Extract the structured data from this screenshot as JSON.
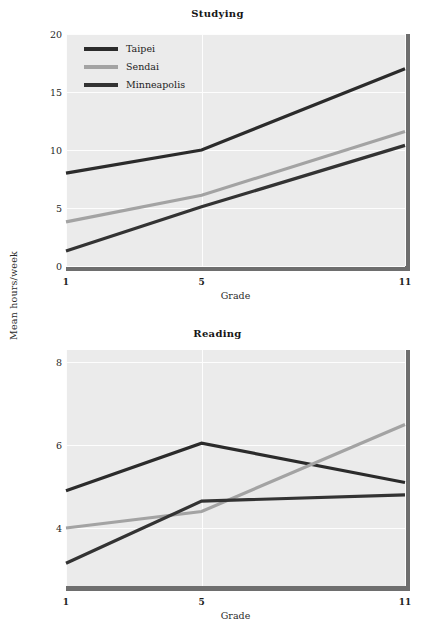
{
  "figure": {
    "shared_ylabel": "Mean hours/week",
    "width": 435,
    "height": 638
  },
  "colors": {
    "taipei": "#2b2b2b",
    "sendai": "#a3a3a3",
    "minneapolis": "#333333",
    "panel_background": "#ebebeb",
    "gridline": "#fdfdfd",
    "panel_shadow": "#6e6e6e",
    "text": "#1a1a1a"
  },
  "legend": {
    "items": [
      {
        "label": "Taipei",
        "color_key": "taipei"
      },
      {
        "label": "Sendai",
        "color_key": "sendai"
      },
      {
        "label": "Minneapolis",
        "color_key": "minneapolis"
      }
    ]
  },
  "chart_data": [
    {
      "type": "line",
      "title": "Studying",
      "xlabel": "Grade",
      "ylabel": "Mean hours/week",
      "x": [
        1,
        5,
        11
      ],
      "xticklabels": [
        "1",
        "5",
        "11"
      ],
      "xlim": [
        1,
        11
      ],
      "ylim": [
        0,
        20
      ],
      "yticks": [
        0,
        5,
        10,
        15,
        20
      ],
      "yticklabels": [
        "0",
        "5",
        "10",
        "15",
        "20"
      ],
      "grid": true,
      "legend_position": "upper left",
      "series": [
        {
          "name": "Taipei",
          "values": [
            8.0,
            10.0,
            17.0
          ]
        },
        {
          "name": "Sendai",
          "values": [
            3.8,
            6.1,
            11.6
          ]
        },
        {
          "name": "Minneapolis",
          "values": [
            1.3,
            5.1,
            10.4
          ]
        }
      ]
    },
    {
      "type": "line",
      "title": "Reading",
      "xlabel": "Grade",
      "ylabel": "Mean hours/week",
      "x": [
        1,
        5,
        11
      ],
      "xticklabels": [
        "1",
        "5",
        "11"
      ],
      "xlim": [
        1,
        11
      ],
      "ylim": [
        2.6,
        8.3
      ],
      "yticks": [
        4,
        6,
        8
      ],
      "yticklabels": [
        "4",
        "6",
        "8"
      ],
      "grid": true,
      "legend_position": "upper left",
      "series": [
        {
          "name": "Taipei",
          "values": [
            4.9,
            6.05,
            5.1
          ]
        },
        {
          "name": "Sendai",
          "values": [
            4.0,
            4.4,
            6.5
          ]
        },
        {
          "name": "Minneapolis",
          "values": [
            3.15,
            4.65,
            4.8
          ]
        }
      ]
    }
  ]
}
